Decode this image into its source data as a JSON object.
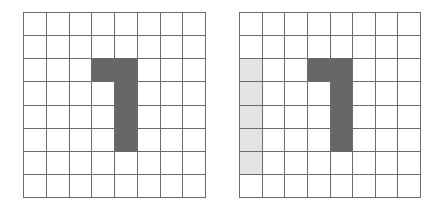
{
  "grids": [
    {
      "id": "grid-left",
      "rows": 8,
      "cols": 8,
      "dark_cells": [
        [
          2,
          3
        ],
        [
          2,
          4
        ],
        [
          3,
          4
        ],
        [
          4,
          4
        ],
        [
          5,
          4
        ]
      ],
      "light_cells": []
    },
    {
      "id": "grid-right",
      "rows": 8,
      "cols": 8,
      "dark_cells": [
        [
          2,
          3
        ],
        [
          2,
          4
        ],
        [
          3,
          4
        ],
        [
          4,
          4
        ],
        [
          5,
          4
        ]
      ],
      "light_cells": [
        [
          2,
          0
        ],
        [
          3,
          0
        ],
        [
          4,
          0
        ],
        [
          5,
          0
        ],
        [
          6,
          0
        ]
      ]
    }
  ],
  "colors": {
    "dark": "#666666",
    "light": "#e4e4e4",
    "line": "#6a6a6a",
    "background": "#ffffff"
  }
}
